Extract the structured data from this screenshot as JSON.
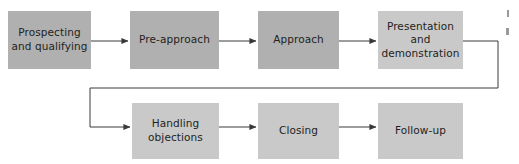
{
  "diagram": {
    "type": "process-flow",
    "orientation": "horizontal-snake",
    "colors": {
      "box_fill_dark": "#b0b0b0",
      "box_fill_light": "#c9c9c9",
      "connector": "#3a3a3a",
      "text": "#231f20",
      "background": "#ffffff"
    },
    "rows": [
      {
        "id": "row-top",
        "steps": [
          {
            "id": "step-1",
            "number": 1,
            "label": "Prospecting\nand qualifying",
            "fill": "#b0b0b0"
          },
          {
            "id": "step-2",
            "number": 2,
            "label": "Pre-approach",
            "fill": "#b0b0b0"
          },
          {
            "id": "step-3",
            "number": 3,
            "label": "Approach",
            "fill": "#b0b0b0"
          },
          {
            "id": "step-4",
            "number": 4,
            "label": "Presentation\nand\ndemonstration",
            "fill": "#c9c9c9"
          }
        ]
      },
      {
        "id": "row-bottom",
        "steps": [
          {
            "id": "step-5",
            "number": 5,
            "label": "Handling\nobjections",
            "fill": "#c9c9c9"
          },
          {
            "id": "step-6",
            "number": 6,
            "label": "Closing",
            "fill": "#c9c9c9"
          },
          {
            "id": "step-7",
            "number": 7,
            "label": "Follow-up",
            "fill": "#c9c9c9"
          }
        ]
      }
    ],
    "connectors": [
      {
        "id": "arrow-1-2",
        "from": "step-1",
        "to": "step-2",
        "style": "straight-arrow"
      },
      {
        "id": "arrow-2-3",
        "from": "step-2",
        "to": "step-3",
        "style": "straight-arrow"
      },
      {
        "id": "arrow-3-4",
        "from": "step-3",
        "to": "step-4",
        "style": "straight-arrow"
      },
      {
        "id": "wrap-4-5",
        "from": "step-4",
        "to": "step-5",
        "style": "elbow-wrap-arrow"
      },
      {
        "id": "arrow-5-6",
        "from": "step-5",
        "to": "step-6",
        "style": "straight-arrow"
      },
      {
        "id": "arrow-6-7",
        "from": "step-6",
        "to": "step-7",
        "style": "straight-arrow"
      }
    ]
  }
}
